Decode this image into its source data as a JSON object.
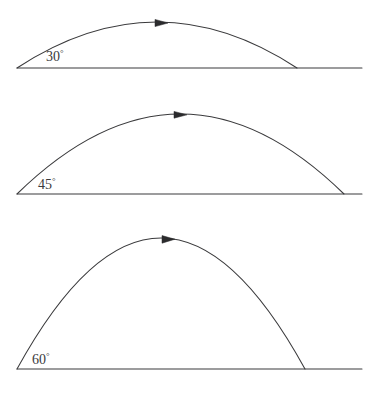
{
  "figure": {
    "background_color": "#ffffff",
    "line_color": "#3a3a3c",
    "arrow_color": "#2b2b2d",
    "label_color": "#3a3a3c",
    "width": 382,
    "height": 404
  },
  "chart_data": {
    "type": "line",
    "xlabel": "",
    "ylabel": "",
    "grid": false,
    "legend": "none",
    "annotations": [
      "30°",
      "45°",
      "60°"
    ],
    "series": [
      {
        "name": "30° trajectory",
        "angle_deg": 30,
        "angle_label": "30",
        "degree_symbol": "°",
        "launch_point": [
          17,
          68
        ],
        "landing_point": [
          297,
          68
        ],
        "apex_point": [
          157,
          22
        ],
        "range_px": 280,
        "max_height_px": 46,
        "ground_line": [
          [
            17,
            68
          ],
          [
            362,
            68
          ]
        ],
        "arrow_at": [
          162,
          23
        ],
        "path": "M 17 68 Q 157 -24 297 68"
      },
      {
        "name": "45° trajectory",
        "angle_deg": 45,
        "angle_label": "45",
        "degree_symbol": "°",
        "launch_point": [
          17,
          194
        ],
        "landing_point": [
          344,
          194
        ],
        "apex_point": [
          180.5,
          114
        ],
        "range_px": 327,
        "max_height_px": 80,
        "ground_line": [
          [
            17,
            194
          ],
          [
            362,
            194
          ]
        ],
        "arrow_at": [
          181,
          115
        ],
        "path": "M 17 194 Q 180.5 34 344 194"
      },
      {
        "name": "60° trajectory",
        "angle_deg": 60,
        "angle_label": "60",
        "degree_symbol": "°",
        "launch_point": [
          17,
          369
        ],
        "landing_point": [
          305,
          369
        ],
        "apex_point": [
          161,
          238
        ],
        "range_px": 288,
        "max_height_px": 131,
        "ground_line": [
          [
            17,
            369
          ],
          [
            362,
            369
          ]
        ],
        "arrow_at": [
          169,
          239
        ],
        "path": "M 17 369 Q 161 107 305 369"
      }
    ]
  },
  "labels": {
    "angle_30": "30",
    "angle_45": "45",
    "angle_60": "60",
    "degree_sign": "°"
  }
}
